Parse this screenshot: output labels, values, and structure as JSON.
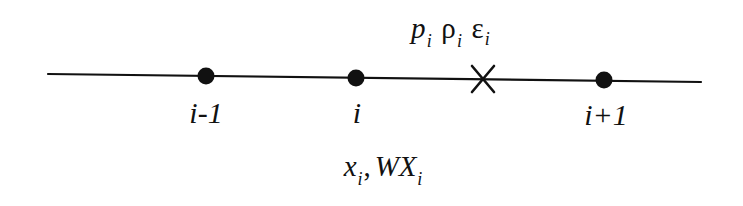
{
  "figure": {
    "type": "staggered-grid-stencil",
    "background_color": "#ffffff",
    "ink_color": "#111111",
    "axis": {
      "x1": 48,
      "y1": 74,
      "x2": 701,
      "y2": 82,
      "stroke_width": 2.2
    },
    "nodes": [
      {
        "id": "node-i-minus-1",
        "label": "i-1",
        "x": 206,
        "y": 76,
        "marker": "filled-dot"
      },
      {
        "id": "node-i",
        "label": "i",
        "x": 356,
        "y": 78,
        "marker": "filled-dot"
      },
      {
        "id": "node-i-plus-1",
        "label": "i+1",
        "x": 604,
        "y": 80,
        "marker": "filled-dot"
      }
    ],
    "zone_center": {
      "id": "zone-center-marker",
      "marker": "cross",
      "x": 483,
      "y": 79,
      "size": 24
    },
    "zone_quantities": {
      "x": 411,
      "y": 14,
      "symbols": [
        {
          "name": "pressure",
          "glyph": "p",
          "style": "italic",
          "subscript": "i"
        },
        {
          "name": "density",
          "glyph": "ρ",
          "style": "upright",
          "subscript": "i"
        },
        {
          "name": "internal-energy",
          "glyph": "ε",
          "style": "upright",
          "subscript": "i"
        }
      ]
    },
    "node_quantities": {
      "x": 383,
      "y": 152,
      "symbols": [
        {
          "name": "position",
          "glyph": "x",
          "style": "italic",
          "subscript": "i"
        },
        {
          "name": "separator",
          "glyph": ",",
          "style": "upright",
          "subscript": ""
        },
        {
          "name": "weighted-position",
          "glyph": "WX",
          "style": "italic",
          "subscript": "i"
        }
      ]
    }
  }
}
